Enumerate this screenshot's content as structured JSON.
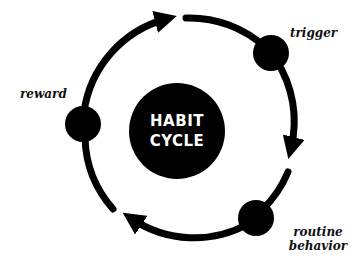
{
  "diagram": {
    "center": {
      "line1": "HABIT",
      "line2": "CYCLE"
    },
    "nodes": [
      {
        "id": "trigger",
        "label_lines": [
          "trigger"
        ]
      },
      {
        "id": "routine",
        "label_lines": [
          "routine",
          "behavior"
        ]
      },
      {
        "id": "reward",
        "label_lines": [
          "reward"
        ]
      }
    ],
    "flow": [
      "reward",
      "trigger",
      "routine",
      "reward"
    ],
    "colors": {
      "ink": "#000000",
      "text_on_center": "#ffffff",
      "background": "#ffffff"
    }
  }
}
